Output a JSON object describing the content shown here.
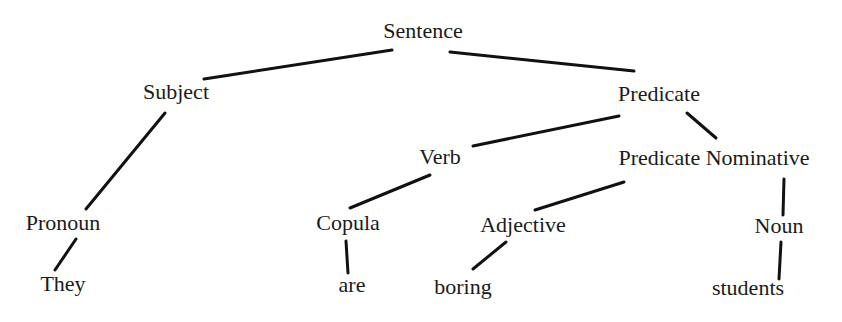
{
  "diagram": {
    "type": "parse-tree",
    "nodes": {
      "sentence": {
        "label": "Sentence"
      },
      "subject": {
        "label": "Subject"
      },
      "predicate": {
        "label": "Predicate"
      },
      "verb": {
        "label": "Verb"
      },
      "predicate_nominative": {
        "label": "Predicate Nominative"
      },
      "pronoun": {
        "label": "Pronoun"
      },
      "copula": {
        "label": "Copula"
      },
      "adjective": {
        "label": "Adjective"
      },
      "noun": {
        "label": "Noun"
      },
      "they": {
        "label": "They"
      },
      "are": {
        "label": "are"
      },
      "boring": {
        "label": "boring"
      },
      "students": {
        "label": "students"
      }
    },
    "edges": [
      [
        "Sentence",
        "Subject"
      ],
      [
        "Sentence",
        "Predicate"
      ],
      [
        "Subject",
        "Pronoun"
      ],
      [
        "Predicate",
        "Verb"
      ],
      [
        "Predicate",
        "Predicate Nominative"
      ],
      [
        "Verb",
        "Copula"
      ],
      [
        "Predicate Nominative",
        "Adjective"
      ],
      [
        "Predicate Nominative",
        "Noun"
      ],
      [
        "Pronoun",
        "They"
      ],
      [
        "Copula",
        "are"
      ],
      [
        "Adjective",
        "boring"
      ],
      [
        "Noun",
        "students"
      ]
    ],
    "colors": {
      "line": "#111111",
      "text": "#1a1a1a",
      "background": "#ffffff"
    }
  }
}
